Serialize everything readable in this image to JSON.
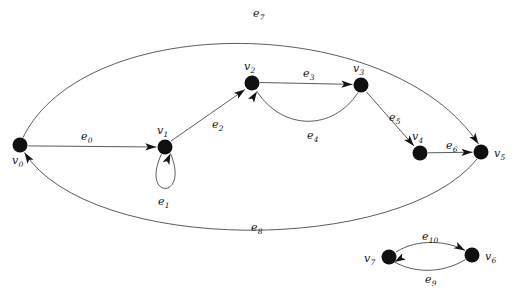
{
  "figure": {
    "type": "directed-multigraph",
    "background_color": "#ffffff",
    "node_color": "#101010",
    "edge_color": "#4a4a4a",
    "label_color": "#131313",
    "width": 516,
    "height": 288
  },
  "nodes": [
    {
      "id": "v0",
      "label": "v",
      "sub": "0",
      "x": 20,
      "y": 145,
      "r": 7.5,
      "label_x": 12,
      "label_y": 155
    },
    {
      "id": "v1",
      "label": "v",
      "sub": "1",
      "x": 165,
      "y": 147,
      "r": 7.5,
      "label_x": 157,
      "label_y": 125
    },
    {
      "id": "v2",
      "label": "v",
      "sub": "2",
      "x": 252,
      "y": 83,
      "r": 7.5,
      "label_x": 244,
      "label_y": 61
    },
    {
      "id": "v3",
      "label": "v",
      "sub": "3",
      "x": 361,
      "y": 85,
      "r": 7.5,
      "label_x": 353,
      "label_y": 63
    },
    {
      "id": "v4",
      "label": "v",
      "sub": "4",
      "x": 420,
      "y": 153,
      "r": 7.5,
      "label_x": 412,
      "label_y": 131
    },
    {
      "id": "v5",
      "label": "v",
      "sub": "5",
      "x": 481,
      "y": 152,
      "r": 7.5,
      "label_x": 494,
      "label_y": 148
    },
    {
      "id": "v6",
      "label": "v",
      "sub": "6",
      "x": 472,
      "y": 255,
      "r": 7.5,
      "label_x": 485,
      "label_y": 251
    },
    {
      "id": "v7",
      "label": "v",
      "sub": "7",
      "x": 389,
      "y": 257,
      "r": 7.5,
      "label_x": 364,
      "label_y": 253
    }
  ],
  "edges": [
    {
      "id": "e0",
      "label": "e",
      "sub": "0",
      "from": "v0",
      "to": "v1",
      "label_x": 81,
      "label_y": 131
    },
    {
      "id": "e1",
      "label": "e",
      "sub": "1",
      "from": "v1",
      "to": "v1",
      "label_x": 158,
      "label_y": 196
    },
    {
      "id": "e2",
      "label": "e",
      "sub": "2",
      "from": "v1",
      "to": "v2",
      "label_x": 212,
      "label_y": 119
    },
    {
      "id": "e3",
      "label": "e",
      "sub": "3",
      "from": "v2",
      "to": "v3",
      "label_x": 303,
      "label_y": 68
    },
    {
      "id": "e4",
      "label": "e",
      "sub": "4",
      "from": "v3",
      "to": "v2",
      "label_x": 307,
      "label_y": 130
    },
    {
      "id": "e5",
      "label": "e",
      "sub": "5",
      "from": "v3",
      "to": "v4",
      "label_x": 389,
      "label_y": 112
    },
    {
      "id": "e6",
      "label": "e",
      "sub": "6",
      "from": "v4",
      "to": "v5",
      "label_x": 446,
      "label_y": 140
    },
    {
      "id": "e7",
      "label": "e",
      "sub": "7",
      "from": "v0",
      "to": "v5",
      "label_x": 253,
      "label_y": 8
    },
    {
      "id": "e8",
      "label": "e",
      "sub": "8",
      "from": "v5",
      "to": "v0",
      "label_x": 251,
      "label_y": 222
    },
    {
      "id": "e9",
      "label": "e",
      "sub": "9",
      "from": "v6",
      "to": "v7",
      "label_x": 425,
      "label_y": 274
    },
    {
      "id": "e10",
      "label": "e",
      "sub": "10",
      "from": "v7",
      "to": "v6",
      "label_x": 422,
      "label_y": 231
    }
  ],
  "paths": {
    "e0": "M 28.4 145.9 L 156.3 147.0",
    "e1": "M 161.5 154.0 C 140 200, 190 200, 170.5 153.5",
    "e2": "M 171.0 141.0 L 245.0 89.5",
    "e3": "M 260.0 82.5 L 352.5 84.4",
    "e4": "M 358.0 92.5 C 333 131, 283 131, 257.0 91.5",
    "e5": "M 366.5 92.0 L 414.0 146.0",
    "e6": "M 428.0 152.8 L 472.5 152.2",
    "e7": "M 23.0 137.5 C 85 11, 390 11, 478.5 144.0",
    "e8": "M 477.0 159.0 C 400 255, 90 255, 24.5 152.5",
    "e9": "M 465.5 259.5 C 440 275, 412 272, 394.5 262.0",
    "e10": "M 396.0 252.0 C 418 238, 448 241, 465.0 250.5"
  },
  "arrows": [
    {
      "edge": "e0",
      "x": 156.3,
      "y": 147.0,
      "angle": 0.5
    },
    {
      "edge": "e1",
      "x": 170.5,
      "y": 153.5,
      "angle": -66
    },
    {
      "edge": "e2",
      "x": 245.0,
      "y": 89.5,
      "angle": -35
    },
    {
      "edge": "e3",
      "x": 352.5,
      "y": 84.4,
      "angle": 1.2
    },
    {
      "edge": "e4",
      "x": 257.0,
      "y": 91.5,
      "angle": -57
    },
    {
      "edge": "e5",
      "x": 414.0,
      "y": 146.0,
      "angle": 49
    },
    {
      "edge": "e6",
      "x": 472.5,
      "y": 152.2,
      "angle": -0.8
    },
    {
      "edge": "e7",
      "x": 478.5,
      "y": 144.0,
      "angle": 56
    },
    {
      "edge": "e8",
      "x": 24.5,
      "y": 152.5,
      "angle": -123
    },
    {
      "edge": "e9",
      "x": 394.5,
      "y": 262.0,
      "angle": 150
    },
    {
      "edge": "e10",
      "x": 465.0,
      "y": 250.5,
      "angle": 29
    }
  ]
}
